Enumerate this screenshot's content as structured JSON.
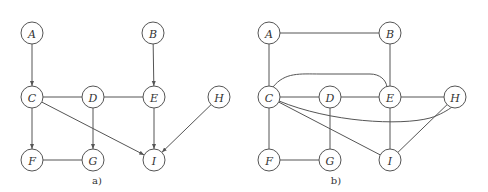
{
  "figure": {
    "panels": [
      {
        "id": "a",
        "caption": "a)",
        "caption_pos": [
          97,
          184
        ],
        "type": "directed-mixed-graph",
        "nodes": [
          {
            "id": "A",
            "label": "A",
            "x": 32,
            "y": 33
          },
          {
            "id": "B",
            "label": "B",
            "x": 153,
            "y": 33
          },
          {
            "id": "C",
            "label": "C",
            "x": 32,
            "y": 97
          },
          {
            "id": "D",
            "label": "D",
            "x": 93,
            "y": 97
          },
          {
            "id": "E",
            "label": "E",
            "x": 154,
            "y": 97
          },
          {
            "id": "H",
            "label": "H",
            "x": 219,
            "y": 97
          },
          {
            "id": "F",
            "label": "F",
            "x": 32,
            "y": 160
          },
          {
            "id": "G",
            "label": "G",
            "x": 93,
            "y": 160
          },
          {
            "id": "I",
            "label": "I",
            "x": 154,
            "y": 160
          }
        ],
        "edges": [
          {
            "from": "A",
            "to": "C",
            "directed": true
          },
          {
            "from": "B",
            "to": "E",
            "directed": true
          },
          {
            "from": "C",
            "to": "D",
            "directed": false
          },
          {
            "from": "D",
            "to": "E",
            "directed": false
          },
          {
            "from": "C",
            "to": "F",
            "directed": true
          },
          {
            "from": "D",
            "to": "G",
            "directed": true
          },
          {
            "from": "C",
            "to": "I",
            "directed": true
          },
          {
            "from": "E",
            "to": "I",
            "directed": true
          },
          {
            "from": "H",
            "to": "I",
            "directed": true
          },
          {
            "from": "F",
            "to": "G",
            "directed": false
          }
        ]
      },
      {
        "id": "b",
        "caption": "b)",
        "caption_pos": [
          336,
          184
        ],
        "type": "undirected-moral-graph",
        "nodes": [
          {
            "id": "A",
            "label": "A",
            "x": 269,
            "y": 33
          },
          {
            "id": "B",
            "label": "B",
            "x": 390,
            "y": 33
          },
          {
            "id": "C",
            "label": "C",
            "x": 269,
            "y": 97
          },
          {
            "id": "D",
            "label": "D",
            "x": 330,
            "y": 97
          },
          {
            "id": "E",
            "label": "E",
            "x": 390,
            "y": 97
          },
          {
            "id": "H",
            "label": "H",
            "x": 455,
            "y": 97
          },
          {
            "id": "F",
            "label": "F",
            "x": 269,
            "y": 160
          },
          {
            "id": "G",
            "label": "G",
            "x": 330,
            "y": 160
          },
          {
            "id": "I",
            "label": "I",
            "x": 390,
            "y": 160
          }
        ],
        "edges": [
          {
            "from": "A",
            "to": "B",
            "directed": false
          },
          {
            "from": "A",
            "to": "C",
            "directed": false
          },
          {
            "from": "B",
            "to": "E",
            "directed": false
          },
          {
            "from": "C",
            "to": "D",
            "directed": false
          },
          {
            "from": "D",
            "to": "E",
            "directed": false
          },
          {
            "from": "E",
            "to": "H",
            "directed": false
          },
          {
            "from": "C",
            "to": "E",
            "directed": false,
            "curve": "M 273 87 C 285 72, 300 74, 320 74 L 370 74 C 380 74, 386 80, 387 87"
          },
          {
            "from": "C",
            "to": "H",
            "directed": false,
            "curve": "M 279 101 C 330 122, 400 126, 430 118 C 440 115, 448 110, 452 107"
          },
          {
            "from": "C",
            "to": "F",
            "directed": false
          },
          {
            "from": "D",
            "to": "G",
            "directed": false
          },
          {
            "from": "C",
            "to": "I",
            "directed": false
          },
          {
            "from": "E",
            "to": "I",
            "directed": false
          },
          {
            "from": "H",
            "to": "I",
            "directed": false
          },
          {
            "from": "F",
            "to": "G",
            "directed": false
          }
        ]
      }
    ],
    "node_radius": 11,
    "colors": {
      "stroke": "#555555",
      "text": "#333333",
      "background": "#ffffff"
    }
  }
}
